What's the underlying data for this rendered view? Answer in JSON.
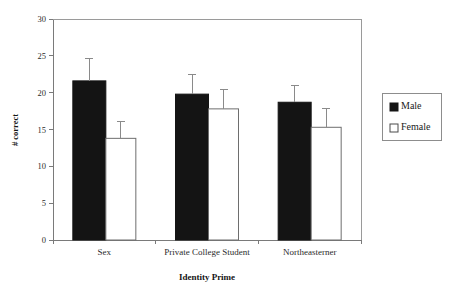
{
  "chart_data": {
    "type": "bar",
    "title": "",
    "subtitle": "",
    "xlabel": "Identity Prime",
    "ylabel": "# correct",
    "categories": [
      "Sex",
      "Private College Student",
      "Northeasterner"
    ],
    "series": [
      {
        "name": "Male",
        "color": "#141414",
        "values": [
          21.6,
          19.8,
          18.7
        ],
        "errors_upper": [
          24.7,
          22.4,
          21.0
        ]
      },
      {
        "name": "Female",
        "color": "#ffffff",
        "values": [
          13.8,
          17.8,
          15.3
        ],
        "errors_upper": [
          16.1,
          20.4,
          17.9
        ]
      }
    ],
    "ylim": [
      0,
      30
    ],
    "yticks": [
      0,
      5,
      10,
      15,
      20,
      25,
      30
    ],
    "ytick_labels": [
      "0",
      "5",
      "10",
      "15",
      "20",
      "25",
      "30"
    ],
    "grid": false,
    "legend_position": "right",
    "error_bar_style": "upper-only-with-cap"
  },
  "legend": {
    "entries": [
      {
        "label": "Male",
        "swatch": "filled-square"
      },
      {
        "label": "Female",
        "swatch": "open-square"
      }
    ]
  },
  "colors": {
    "male_fill": "#141414",
    "female_fill": "#ffffff",
    "axis": "#7a7a7a",
    "frame": "#9a9a9a",
    "text": "#1a1a1a",
    "background": "#ffffff"
  }
}
